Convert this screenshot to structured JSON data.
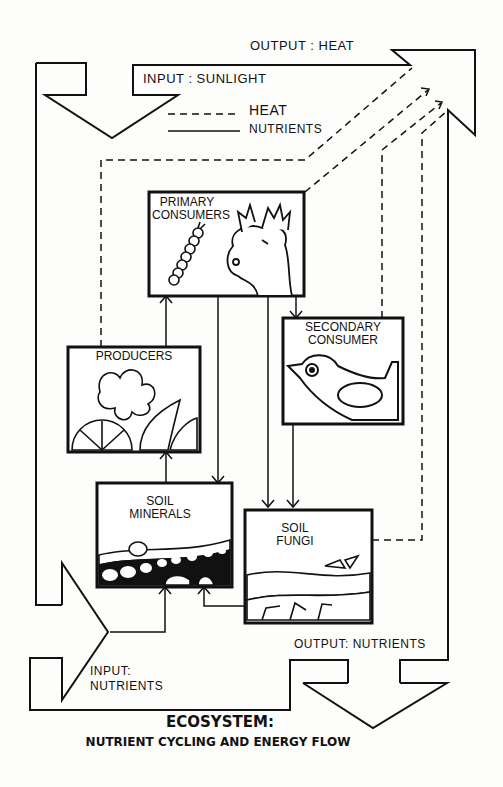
{
  "diagram": {
    "title": "ECOSYSTEM:",
    "subtitle": "NUTRIENT CYCLING AND ENERGY FLOW",
    "legend": {
      "heat": "HEAT",
      "nutrients": "NUTRIENTS"
    },
    "io": {
      "output_heat": "OUTPUT : HEAT",
      "input_sunlight": "INPUT : SUNLIGHT",
      "input_nutrients_line1": "INPUT:",
      "input_nutrients_line2": "NUTRIENTS",
      "output_nutrients": "OUTPUT: NUTRIENTS"
    },
    "nodes": {
      "primary_consumers": {
        "line1": "PRIMARY",
        "line2": "CONSUMERS",
        "icon": "caterpillar-and-deer"
      },
      "producers": {
        "line1": "PRODUCERS",
        "icon": "plants"
      },
      "secondary_consumer": {
        "line1": "SECONDARY",
        "line2": "CONSUMER",
        "icon": "bird"
      },
      "soil_minerals": {
        "line1": "SOIL",
        "line2": "MINERALS",
        "icon": "soil-layers"
      },
      "soil_fungi": {
        "line1": "SOIL",
        "line2": "FUNGI",
        "icon": "fungi-roots"
      }
    },
    "edges": [
      {
        "from": "producers",
        "to": "primary_consumers",
        "type": "nutrients"
      },
      {
        "from": "primary_consumers",
        "to": "soil_minerals",
        "type": "nutrients"
      },
      {
        "from": "primary_consumers",
        "to": "soil_fungi",
        "type": "nutrients"
      },
      {
        "from": "primary_consumers",
        "to": "secondary_consumer",
        "type": "nutrients"
      },
      {
        "from": "secondary_consumer",
        "to": "soil_fungi",
        "type": "nutrients"
      },
      {
        "from": "soil_minerals",
        "to": "producers",
        "type": "nutrients"
      },
      {
        "from": "soil_fungi",
        "to": "soil_minerals",
        "type": "nutrients"
      },
      {
        "from": "input_nutrients",
        "to": "soil_minerals",
        "type": "nutrients"
      },
      {
        "from": "producers",
        "to": "output_heat",
        "type": "heat"
      },
      {
        "from": "primary_consumers",
        "to": "output_heat",
        "type": "heat"
      },
      {
        "from": "secondary_consumer",
        "to": "output_heat",
        "type": "heat"
      },
      {
        "from": "soil_fungi",
        "to": "output_heat",
        "type": "heat"
      }
    ]
  }
}
